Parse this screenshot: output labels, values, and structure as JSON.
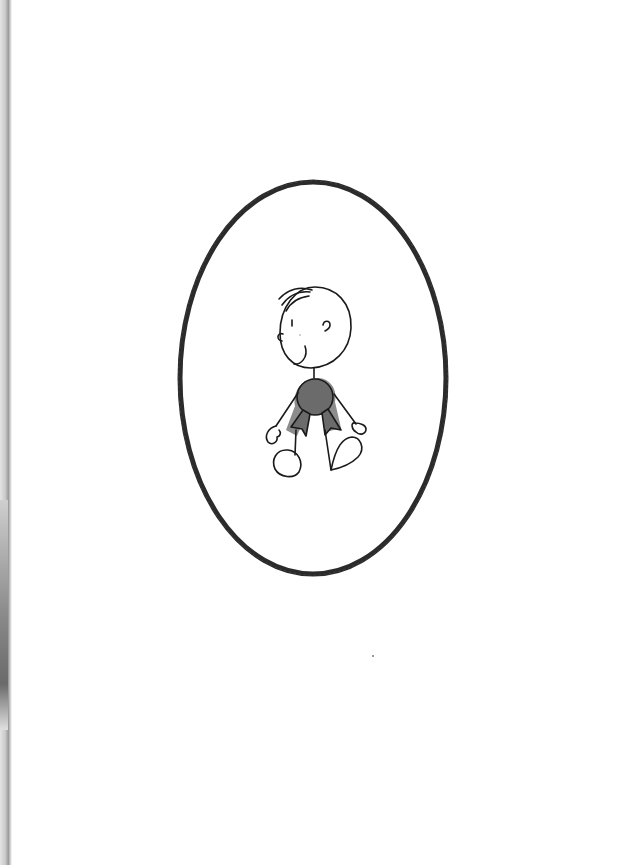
{
  "page": {
    "background": "#ffffff"
  },
  "illustration": {
    "frame": {
      "shape": "oval",
      "stroke": "#2b2b2b",
      "cx": 313,
      "cy": 378,
      "rx": 133,
      "ry": 196
    },
    "figure": {
      "subject": "cartoon-child",
      "head_outline": "#1a1a1a",
      "shirt_fill": "#6b6b6b",
      "shirt_shadow": "#8c8c8c"
    }
  }
}
